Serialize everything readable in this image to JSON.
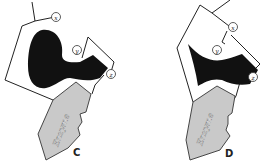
{
  "diagram": {
    "panels": [
      {
        "id": "C",
        "label": "C",
        "enzyme_label": "Enzyme",
        "sites": [
          "x",
          "y",
          "z"
        ]
      },
      {
        "id": "D",
        "label": "D",
        "enzyme_label": "Enzyme",
        "sites": [
          "x",
          "y",
          "z"
        ]
      }
    ],
    "colors": {
      "substrate": "#111111",
      "enzyme_fill": "#c9c9c9",
      "outline": "#222222"
    }
  }
}
